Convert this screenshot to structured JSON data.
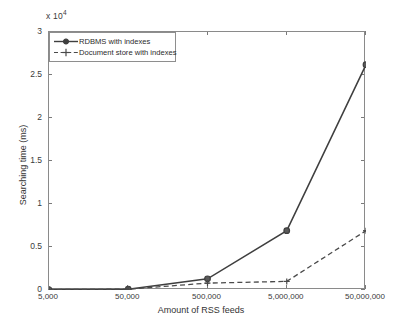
{
  "chart_data": {
    "type": "line",
    "title": "",
    "subtitle": "",
    "xlabel": "Amount of RSS feeds",
    "ylabel": "Searching time (ms)",
    "y_multiplier_text": "x 10",
    "y_multiplier_exponent": "4",
    "categories": [
      "5,000",
      "50,000",
      "500,000",
      "5,000,000",
      "50,000,000"
    ],
    "xticklabels": [
      "5,000",
      "50,000",
      "500,000",
      "5,000,000",
      "50,000,000"
    ],
    "yticklabels": [
      "0",
      "0.5",
      "1",
      "1.5",
      "2",
      "2.5",
      "3"
    ],
    "ytickvalues": [
      0,
      0.5,
      1,
      1.5,
      2,
      2.5,
      3
    ],
    "ylim": [
      0,
      3
    ],
    "xlim": [
      0,
      4
    ],
    "grid": false,
    "legend_position": "top-left-inside",
    "series": [
      {
        "name": "RDBMS with indexes",
        "values": [
          0.005,
          0.01,
          0.13,
          0.69,
          2.62
        ],
        "linestyle": "solid",
        "marker": "circle",
        "color": "#3f3f3f"
      },
      {
        "name": "Document store with indexes",
        "values": [
          0.005,
          0.01,
          0.08,
          0.1,
          0.69
        ],
        "linestyle": "dashed",
        "marker": "plus",
        "color": "#4a4a4a"
      }
    ]
  },
  "legend": {
    "entries": [
      {
        "label": "RDBMS with indexes"
      },
      {
        "label": "Document store with indexes"
      }
    ]
  },
  "colors": {
    "axis": "#8a8a8a",
    "text": "#2b2b2b",
    "series_1": "#3f3f3f",
    "series_2": "#4a4a4a",
    "background": "#ffffff"
  }
}
